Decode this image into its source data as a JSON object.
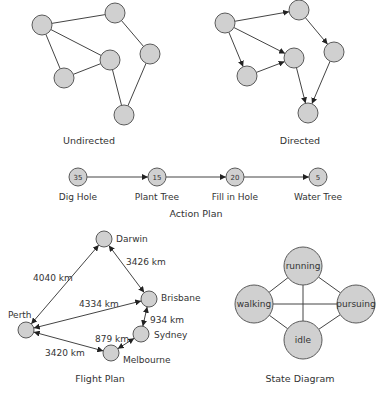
{
  "undirected": {
    "caption": "Undirected",
    "nodes": [
      {
        "id": "A",
        "x": 42,
        "y": 25
      },
      {
        "id": "B",
        "x": 115,
        "y": 13
      },
      {
        "id": "C",
        "x": 64,
        "y": 78
      },
      {
        "id": "D",
        "x": 110,
        "y": 60
      },
      {
        "id": "E",
        "x": 150,
        "y": 54
      },
      {
        "id": "F",
        "x": 124,
        "y": 115
      }
    ],
    "edges": [
      [
        "A",
        "B"
      ],
      [
        "A",
        "C"
      ],
      [
        "A",
        "D"
      ],
      [
        "C",
        "D"
      ],
      [
        "D",
        "F"
      ],
      [
        "B",
        "E"
      ],
      [
        "E",
        "F"
      ]
    ]
  },
  "directed": {
    "caption": "Directed",
    "nodes": [
      {
        "id": "A",
        "x": 225,
        "y": 23
      },
      {
        "id": "B",
        "x": 299,
        "y": 10
      },
      {
        "id": "C",
        "x": 247,
        "y": 76
      },
      {
        "id": "D",
        "x": 294,
        "y": 58
      },
      {
        "id": "E",
        "x": 334,
        "y": 52
      },
      {
        "id": "F",
        "x": 308,
        "y": 113
      }
    ],
    "edges": [
      [
        "A",
        "B"
      ],
      [
        "A",
        "C"
      ],
      [
        "A",
        "D"
      ],
      [
        "C",
        "D"
      ],
      [
        "D",
        "F"
      ],
      [
        "B",
        "E"
      ],
      [
        "E",
        "F"
      ]
    ]
  },
  "action_plan": {
    "caption": "Action Plan",
    "steps": [
      {
        "value": "35",
        "label": "Dig Hole",
        "x": 78
      },
      {
        "value": "15",
        "label": "Plant Tree",
        "x": 157
      },
      {
        "value": "20",
        "label": "Fill in Hole",
        "x": 235
      },
      {
        "value": "5",
        "label": "Water Tree",
        "x": 318
      }
    ]
  },
  "flight_plan": {
    "caption": "Flight Plan",
    "cities": [
      {
        "name": "Darwin",
        "x": 104,
        "y": 239,
        "lx": 116,
        "ly": 242
      },
      {
        "name": "Brisbane",
        "x": 149,
        "y": 299,
        "lx": 161,
        "ly": 301
      },
      {
        "name": "Perth",
        "x": 26,
        "y": 330,
        "lx": 8,
        "ly": 318
      },
      {
        "name": "Sydney",
        "x": 141,
        "y": 334,
        "lx": 154,
        "ly": 338
      },
      {
        "name": "Melbourne",
        "x": 111,
        "y": 353,
        "lx": 123,
        "ly": 363
      }
    ],
    "routes": [
      {
        "from": "Perth",
        "to": "Darwin",
        "label": "4040 km",
        "lx": 33,
        "ly": 281
      },
      {
        "from": "Darwin",
        "to": "Brisbane",
        "label": "3426 km",
        "lx": 126,
        "ly": 265
      },
      {
        "from": "Perth",
        "to": "Brisbane",
        "label": "4334 km",
        "lx": 79,
        "ly": 307
      },
      {
        "from": "Brisbane",
        "to": "Sydney",
        "label": "934 km",
        "lx": 150,
        "ly": 323
      },
      {
        "from": "Sydney",
        "to": "Melbourne",
        "label": "879 km",
        "lx": 95,
        "ly": 342
      },
      {
        "from": "Perth",
        "to": "Melbourne",
        "label": "3420 km",
        "lx": 45,
        "ly": 356
      }
    ]
  },
  "state_diagram": {
    "caption": "State Diagram",
    "states": [
      {
        "name": "running",
        "x": 303,
        "y": 266
      },
      {
        "name": "walking",
        "x": 254,
        "y": 304
      },
      {
        "name": "pursuing",
        "x": 356,
        "y": 304
      },
      {
        "name": "idle",
        "x": 303,
        "y": 340
      }
    ],
    "transitions": [
      [
        "running",
        "walking"
      ],
      [
        "running",
        "pursuing"
      ],
      [
        "running",
        "idle"
      ],
      [
        "walking",
        "pursuing"
      ],
      [
        "walking",
        "idle"
      ],
      [
        "idle",
        "pursuing"
      ]
    ]
  }
}
